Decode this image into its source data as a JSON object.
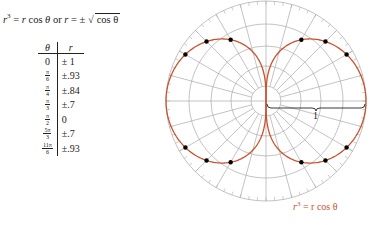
{
  "header": {
    "equation_lhs": "r",
    "equation_lhs_exp": "3",
    "equation_eq1": " = ",
    "equation_rhs1": "r",
    "equation_cos1": " cos ",
    "equation_theta1": "θ",
    "equation_or": " or ",
    "equation_r2": "r",
    "equation_eq2": " = ± ",
    "equation_sqrt_symbol": "√",
    "equation_sqrt_content": "cos θ"
  },
  "table": {
    "col_theta": "θ",
    "col_r": "r",
    "rows": [
      {
        "theta_plain": "0",
        "r": "± 1"
      },
      {
        "theta_num": "π",
        "theta_den": "6",
        "r": "±.93"
      },
      {
        "theta_num": "π",
        "theta_den": "4",
        "r": "±.84"
      },
      {
        "theta_num": "π",
        "theta_den": "3",
        "r": "±.7"
      },
      {
        "theta_num": "π",
        "theta_den": "2",
        "r": "0"
      },
      {
        "theta_num": "5π",
        "theta_den": "3",
        "r": "±.7"
      },
      {
        "theta_num": "11π",
        "theta_den": "6",
        "r": "±.93"
      }
    ]
  },
  "plot": {
    "scale_label": "1",
    "curve_label_r": "r",
    "curve_label_exp": "3",
    "curve_label_rest": " = r cos θ",
    "colors": {
      "curve": "#c8532e",
      "grid": "#a9a9a9",
      "points": "#000000",
      "brace": "#222222"
    }
  },
  "chart_data": {
    "type": "polar",
    "equation": "r = ±√(cos θ)",
    "table": [
      {
        "theta": "0",
        "r": "±1"
      },
      {
        "theta": "π/6",
        "r": "±0.93"
      },
      {
        "theta": "π/4",
        "r": "±0.84"
      },
      {
        "theta": "π/3",
        "r": "±0.7"
      },
      {
        "theta": "π/2",
        "r": "0"
      },
      {
        "theta": "5π/3",
        "r": "±0.7"
      },
      {
        "theta": "11π/6",
        "r": "±0.93"
      }
    ],
    "marked_points_angles_deg": [
      30,
      45,
      60,
      120,
      135,
      150,
      210,
      225,
      240,
      300,
      315,
      330
    ],
    "r_max": 1,
    "grid": "polar",
    "curve_color": "#c8532e"
  }
}
